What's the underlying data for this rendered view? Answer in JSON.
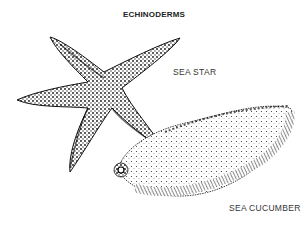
{
  "title": "ECHINODERMS",
  "illustrations": [
    {
      "name": "sea-star",
      "label": "SEA STAR"
    },
    {
      "name": "sea-cucumber",
      "label": "SEA CUCUMBER"
    }
  ],
  "colors": {
    "ink": "#1a1a1a",
    "background": "#ffffff",
    "text": "#333333"
  }
}
